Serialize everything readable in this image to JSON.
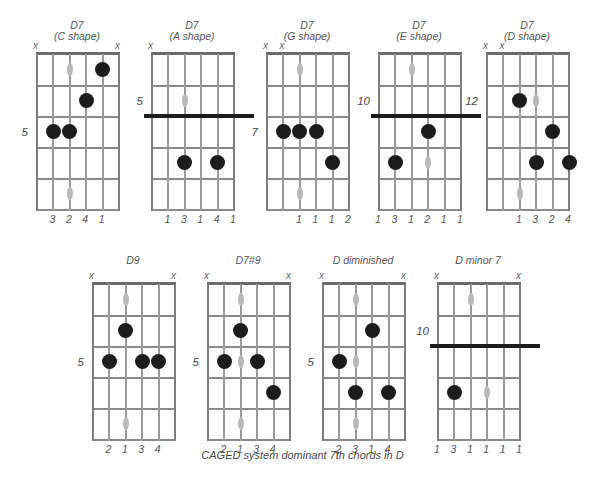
{
  "caption": "CAGED system dominant 7th chords in D",
  "icons": {
    "mute": "x"
  },
  "geometry": {
    "strings": 6,
    "frets": 5,
    "grid_width": 82,
    "grid_height": 155,
    "string_gap": 16.4,
    "fret_gap": 31
  },
  "diagrams": [
    {
      "id": "d7-c-shape",
      "title_line1": "D7",
      "title_line2": "(C shape)",
      "x": 36,
      "y": 20,
      "position_label": "5",
      "position_fret": 3,
      "muted_strings": [
        1,
        6
      ],
      "open_strings": [],
      "barre": null,
      "dots": [
        {
          "string": 5,
          "fret": 1
        },
        {
          "string": 4,
          "fret": 2
        },
        {
          "string": 2,
          "fret": 3
        },
        {
          "string": 3,
          "fret": 3
        }
      ],
      "markers": [
        {
          "string": 3,
          "fret": 1
        },
        {
          "string": 3,
          "fret": 3
        },
        {
          "string": 3,
          "fret": 5
        }
      ],
      "fingers": [
        {
          "string": 2,
          "label": "3"
        },
        {
          "string": 3,
          "label": "2"
        },
        {
          "string": 4,
          "label": "4"
        },
        {
          "string": 5,
          "label": "1"
        }
      ]
    },
    {
      "id": "d7-a-shape",
      "title_line1": "D7",
      "title_line2": "(A shape)",
      "x": 151,
      "y": 20,
      "position_label": "5",
      "position_fret": 2,
      "muted_strings": [
        1
      ],
      "open_strings": [],
      "barre": {
        "fret": 2,
        "from_string": 1,
        "to_string": 6,
        "extend": true
      },
      "dots": [
        {
          "string": 3,
          "fret": 4
        },
        {
          "string": 5,
          "fret": 4
        }
      ],
      "markers": [
        {
          "string": 3,
          "fret": 2
        },
        {
          "string": 3,
          "fret": 4
        }
      ],
      "fingers": [
        {
          "string": 2,
          "label": "1"
        },
        {
          "string": 3,
          "label": "3"
        },
        {
          "string": 4,
          "label": "1"
        },
        {
          "string": 5,
          "label": "4"
        },
        {
          "string": 6,
          "label": "1"
        }
      ]
    },
    {
      "id": "d7-g-shape",
      "title_line1": "D7",
      "title_line2": "(G shape)",
      "x": 266,
      "y": 20,
      "position_label": "7",
      "position_fret": 3,
      "muted_strings": [
        1,
        2
      ],
      "open_strings": [],
      "barre": null,
      "dots": [
        {
          "string": 2,
          "fret": 3
        },
        {
          "string": 3,
          "fret": 3
        },
        {
          "string": 4,
          "fret": 3
        },
        {
          "string": 5,
          "fret": 4
        }
      ],
      "markers": [
        {
          "string": 3,
          "fret": 1
        },
        {
          "string": 3,
          "fret": 3
        },
        {
          "string": 3,
          "fret": 5
        }
      ],
      "fingers": [
        {
          "string": 3,
          "label": "1"
        },
        {
          "string": 4,
          "label": "1"
        },
        {
          "string": 5,
          "label": "1"
        },
        {
          "string": 6,
          "label": "2"
        }
      ]
    },
    {
      "id": "d7-e-shape",
      "title_line1": "D7",
      "title_line2": "(E shape)",
      "x": 378,
      "y": 20,
      "position_label": "10",
      "position_fret": 2,
      "muted_strings": [],
      "open_strings": [],
      "barre": {
        "fret": 2,
        "from_string": 1,
        "to_string": 6,
        "extend": true
      },
      "dots": [
        {
          "string": 4,
          "fret": 3
        },
        {
          "string": 2,
          "fret": 4
        }
      ],
      "markers": [
        {
          "string": 3,
          "fret": 1
        },
        {
          "string": 2,
          "fret": 4
        },
        {
          "string": 4,
          "fret": 4
        }
      ],
      "fingers": [
        {
          "string": 1,
          "label": "1"
        },
        {
          "string": 2,
          "label": "3"
        },
        {
          "string": 3,
          "label": "1"
        },
        {
          "string": 4,
          "label": "2"
        },
        {
          "string": 5,
          "label": "1"
        },
        {
          "string": 6,
          "label": "1"
        }
      ]
    },
    {
      "id": "d7-d-shape",
      "title_line1": "D7",
      "title_line2": "(D shape)",
      "x": 486,
      "y": 20,
      "position_label": "12",
      "position_fret": 2,
      "muted_strings": [
        1,
        2
      ],
      "open_strings": [],
      "barre": null,
      "dots": [
        {
          "string": 3,
          "fret": 2
        },
        {
          "string": 5,
          "fret": 3
        },
        {
          "string": 4,
          "fret": 4
        },
        {
          "string": 6,
          "fret": 4
        }
      ],
      "markers": [
        {
          "string": 4,
          "fret": 2
        },
        {
          "string": 3,
          "fret": 5
        }
      ],
      "fingers": [
        {
          "string": 3,
          "label": "1"
        },
        {
          "string": 4,
          "label": "3"
        },
        {
          "string": 5,
          "label": "2"
        },
        {
          "string": 6,
          "label": "4"
        }
      ]
    },
    {
      "id": "d9",
      "title_line1": "D9",
      "title_line2": "",
      "x": 92,
      "y": 250,
      "position_label": "5",
      "position_fret": 3,
      "muted_strings": [
        1,
        6
      ],
      "open_strings": [],
      "barre": null,
      "dots": [
        {
          "string": 3,
          "fret": 2
        },
        {
          "string": 2,
          "fret": 3
        },
        {
          "string": 4,
          "fret": 3
        },
        {
          "string": 5,
          "fret": 3
        }
      ],
      "markers": [
        {
          "string": 3,
          "fret": 1
        },
        {
          "string": 3,
          "fret": 5
        }
      ],
      "fingers": [
        {
          "string": 2,
          "label": "2"
        },
        {
          "string": 3,
          "label": "1"
        },
        {
          "string": 4,
          "label": "3"
        },
        {
          "string": 5,
          "label": "4"
        }
      ]
    },
    {
      "id": "d7sharp9",
      "title_line1": "D7#9",
      "title_line2": "",
      "x": 207,
      "y": 250,
      "position_label": "5",
      "position_fret": 3,
      "muted_strings": [
        1,
        6
      ],
      "open_strings": [],
      "barre": null,
      "dots": [
        {
          "string": 3,
          "fret": 2
        },
        {
          "string": 2,
          "fret": 3
        },
        {
          "string": 4,
          "fret": 3
        },
        {
          "string": 5,
          "fret": 4
        }
      ],
      "markers": [
        {
          "string": 3,
          "fret": 1
        },
        {
          "string": 3,
          "fret": 3
        },
        {
          "string": 3,
          "fret": 5
        }
      ],
      "fingers": [
        {
          "string": 2,
          "label": "2"
        },
        {
          "string": 3,
          "label": "1"
        },
        {
          "string": 4,
          "label": "3"
        },
        {
          "string": 5,
          "label": "4"
        }
      ]
    },
    {
      "id": "d-diminished",
      "title_line1": "D diminished",
      "title_line2": "",
      "x": 322,
      "y": 250,
      "position_label": "5",
      "position_fret": 3,
      "muted_strings": [
        1,
        6
      ],
      "open_strings": [],
      "barre": null,
      "dots": [
        {
          "string": 4,
          "fret": 2
        },
        {
          "string": 2,
          "fret": 3
        },
        {
          "string": 3,
          "fret": 4
        },
        {
          "string": 5,
          "fret": 4
        }
      ],
      "markers": [
        {
          "string": 3,
          "fret": 1
        },
        {
          "string": 3,
          "fret": 3
        },
        {
          "string": 3,
          "fret": 5
        }
      ],
      "fingers": [
        {
          "string": 2,
          "label": "2"
        },
        {
          "string": 3,
          "label": "3"
        },
        {
          "string": 4,
          "label": "1"
        },
        {
          "string": 5,
          "label": "4"
        }
      ]
    },
    {
      "id": "d-minor-7",
      "title_line1": "D minor 7",
      "title_line2": "",
      "x": 437,
      "y": 250,
      "position_label": "10",
      "position_fret": 2,
      "muted_strings": [
        1,
        6
      ],
      "open_strings": [],
      "barre": {
        "fret": 2,
        "from_string": 1,
        "to_string": 6,
        "extend": true
      },
      "dots": [
        {
          "string": 2,
          "fret": 4
        }
      ],
      "markers": [
        {
          "string": 3,
          "fret": 1
        },
        {
          "string": 4,
          "fret": 4
        }
      ],
      "fingers": [
        {
          "string": 1,
          "label": "1"
        },
        {
          "string": 2,
          "label": "3"
        },
        {
          "string": 3,
          "label": "1"
        },
        {
          "string": 4,
          "label": "1"
        },
        {
          "string": 5,
          "label": "1"
        },
        {
          "string": 6,
          "label": "1"
        }
      ]
    }
  ]
}
